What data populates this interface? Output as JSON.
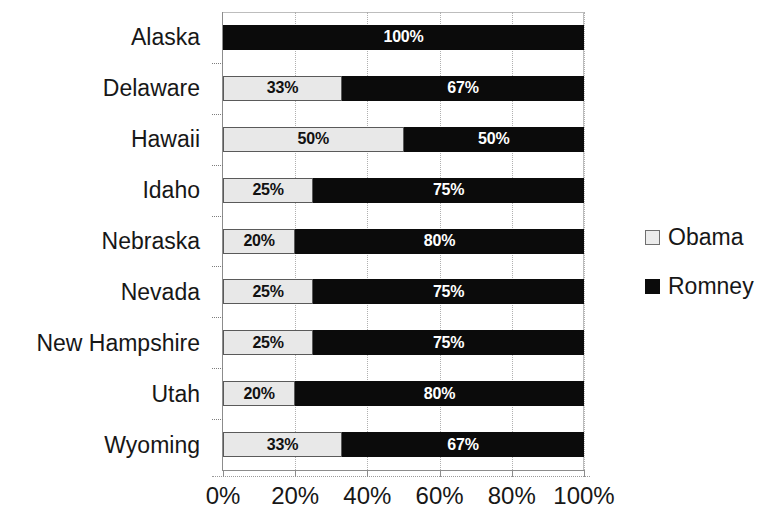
{
  "chart_data": {
    "type": "bar",
    "subtype": "stacked-horizontal-100-percent",
    "title": "",
    "xlabel": "",
    "ylabel": "",
    "orientation": "horizontal",
    "stacked": true,
    "grid": true,
    "xlim": [
      0,
      100
    ],
    "xticks": [
      0,
      20,
      40,
      60,
      80,
      100
    ],
    "xtick_labels": [
      "0%",
      "20%",
      "40%",
      "60%",
      "80%",
      "100%"
    ],
    "legend_position": "right",
    "categories": [
      "Alaska",
      "Delaware",
      "Hawaii",
      "Idaho",
      "Nebraska",
      "Nevada",
      "New Hampshire",
      "Utah",
      "Wyoming"
    ],
    "series": [
      {
        "name": "Obama",
        "color": "#e8e8e8",
        "values": [
          0,
          33,
          50,
          25,
          20,
          25,
          25,
          20,
          33
        ],
        "labels": [
          "",
          "33%",
          "50%",
          "25%",
          "20%",
          "25%",
          "25%",
          "20%",
          "33%"
        ]
      },
      {
        "name": "Romney",
        "color": "#0b0b0b",
        "values": [
          100,
          67,
          50,
          75,
          80,
          75,
          75,
          80,
          67
        ],
        "labels": [
          "100%",
          "67%",
          "50%",
          "75%",
          "80%",
          "75%",
          "75%",
          "80%",
          "67%"
        ]
      }
    ]
  },
  "legend": {
    "items": [
      {
        "label": "Obama",
        "swatch": "obama-swatch"
      },
      {
        "label": "Romney",
        "swatch": "romney-swatch"
      }
    ]
  }
}
